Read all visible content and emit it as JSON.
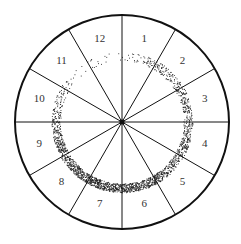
{
  "diagram": {
    "type": "circular sector diagram with stippled ring",
    "center": [
      122,
      122
    ],
    "outer_radius": 107,
    "ring_radius": 66,
    "ring_width": 9,
    "sector_count": 12,
    "sectors": [
      {
        "label": "1"
      },
      {
        "label": "2"
      },
      {
        "label": "3"
      },
      {
        "label": "4"
      },
      {
        "label": "5"
      },
      {
        "label": "6"
      },
      {
        "label": "7"
      },
      {
        "label": "8"
      },
      {
        "label": "9"
      },
      {
        "label": "10"
      },
      {
        "label": "11"
      },
      {
        "label": "12"
      }
    ],
    "ring_density_by_sector": {
      "1": 0.05,
      "2": 0.25,
      "3": 0.35,
      "4": 0.45,
      "5": 0.6,
      "6": 0.8,
      "7": 1.0,
      "8": 1.0,
      "9": 0.75,
      "10": 0.45,
      "11": 0.15,
      "12": 0.03
    },
    "colors": {
      "line": "#111111",
      "stipple": "#222222",
      "background": "#ffffff"
    }
  }
}
